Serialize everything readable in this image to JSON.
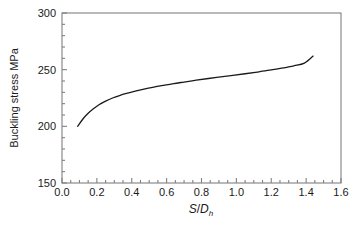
{
  "chart_data": {
    "type": "line",
    "title": "",
    "subtitle": "",
    "xlabel": "S/Dh",
    "xlabel_parts": {
      "numerator": "S",
      "slash": "/",
      "denominator": "D",
      "subscript": "h"
    },
    "ylabel": "Buckling stress MPa",
    "xlim": [
      0.0,
      1.6
    ],
    "ylim": [
      150,
      300
    ],
    "xticks": [
      "0.0",
      "0.2",
      "0.4",
      "0.6",
      "0.8",
      "1.0",
      "1.2",
      "1.4",
      "1.6"
    ],
    "xtick_values": [
      0.0,
      0.2,
      0.4,
      0.6,
      0.8,
      1.0,
      1.2,
      1.4,
      1.6
    ],
    "yticks": [
      "150",
      "200",
      "250",
      "300"
    ],
    "ytick_values": [
      150,
      200,
      250,
      300
    ],
    "x_minor_interval": 0.05,
    "y_minor_interval": 10,
    "grid": false,
    "legend": false,
    "legend_position": "none",
    "line_color": "#1a1a1a",
    "line_width": 1.3,
    "frame_color": "#808080",
    "background_color": "#ffffff",
    "series": [
      {
        "name": "Buckling stress",
        "x": [
          0.09,
          0.12,
          0.15,
          0.18,
          0.21,
          0.25,
          0.29,
          0.33,
          0.37,
          0.42,
          0.47,
          0.52,
          0.58,
          0.64,
          0.7,
          0.77,
          0.84,
          0.91,
          0.98,
          1.05,
          1.12,
          1.19,
          1.26,
          1.33,
          1.39,
          1.44
        ],
        "y": [
          200.0,
          206.5,
          211.5,
          215.5,
          218.8,
          222.2,
          225.0,
          227.2,
          229.0,
          231.0,
          232.8,
          234.4,
          236.1,
          237.7,
          239.1,
          240.7,
          242.2,
          243.6,
          245.0,
          246.4,
          247.9,
          249.5,
          251.3,
          253.4,
          255.8,
          262.0
        ]
      }
    ]
  },
  "axes": {
    "ylabel_text": "Buckling stress MPa"
  }
}
